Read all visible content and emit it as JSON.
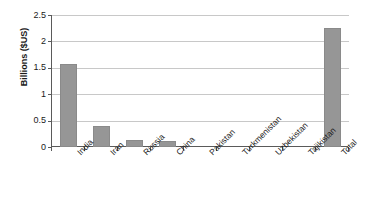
{
  "chart_data": {
    "type": "bar",
    "title": "",
    "subtitle": "",
    "xlabel": "",
    "ylabel": "Billions ($US)",
    "categories": [
      "India",
      "Iran",
      "Russia",
      "China",
      "Pakistan",
      "Turkmenistan",
      "Uzbekistan",
      "Tajikistan",
      "Total"
    ],
    "values": [
      1.57,
      0.39,
      0.14,
      0.12,
      0,
      0,
      0,
      0,
      2.25
    ],
    "ylim": [
      0,
      2.5
    ],
    "ytick_labels": [
      "0",
      "0.5",
      "1",
      "1.5",
      "2",
      "2.5"
    ],
    "ytick_values": [
      0,
      0.5,
      1,
      1.5,
      2,
      2.5
    ],
    "grid": true,
    "legend": false,
    "legend_position": "none",
    "bar_color": "#969696",
    "gridline_color": "#c8c8c8",
    "axis_color": "#5a5a5a",
    "background_color": "#ffffff",
    "xtick_label_rotation": -45
  }
}
